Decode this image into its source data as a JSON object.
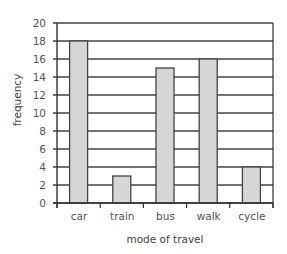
{
  "chart_data": {
    "type": "bar",
    "title": "",
    "xlabel": "mode of travel",
    "ylabel": "frequency",
    "categories": [
      "car",
      "train",
      "bus",
      "walk",
      "cycle"
    ],
    "values": [
      18,
      3,
      15,
      16,
      4
    ],
    "y_tick_labels": [
      "20",
      "18",
      "16",
      "14",
      "12",
      "10",
      "8",
      "6",
      "4",
      "2",
      "0"
    ],
    "ylim": [
      -2,
      20
    ],
    "grid": true,
    "legend": null,
    "note": "Y-axis labels are offset: label '0' sits one gridline above the baseline; bars start at the baseline. Values read against labels.",
    "colors": {
      "bar_fill": "#d6d6d6",
      "bar_stroke": "#444444",
      "grid": "#444444"
    }
  }
}
